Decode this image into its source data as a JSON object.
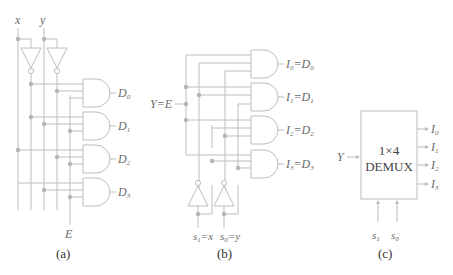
{
  "panels": {
    "a": {
      "caption": "(a)",
      "inputs": {
        "x": "x",
        "y": "y",
        "enable": "E"
      },
      "outputs": [
        {
          "name": "D",
          "sub": "0"
        },
        {
          "name": "D",
          "sub": "1"
        },
        {
          "name": "D",
          "sub": "2"
        },
        {
          "name": "D",
          "sub": "3"
        }
      ],
      "gates": {
        "not_count": 2,
        "and_count": 4
      }
    },
    "b": {
      "caption": "(b)",
      "data_input": "Y=E",
      "select_labels": [
        {
          "name": "s",
          "sub": "1",
          "eq": "=x"
        },
        {
          "name": "s",
          "sub": "0",
          "eq": "=y"
        }
      ],
      "outputs": [
        {
          "name": "I",
          "sub": "0",
          "eq": "=D",
          "eq_sub": "0"
        },
        {
          "name": "I",
          "sub": "1",
          "eq": "=D",
          "eq_sub": "1"
        },
        {
          "name": "I",
          "sub": "2",
          "eq": "=D",
          "eq_sub": "2"
        },
        {
          "name": "I",
          "sub": "3",
          "eq": "=D",
          "eq_sub": "3"
        }
      ],
      "gates": {
        "not_count": 2,
        "and_count": 4
      }
    },
    "c": {
      "caption": "(c)",
      "block_line1": "1×4",
      "block_line2": "DEMUX",
      "input": "Y",
      "outputs": [
        {
          "name": "I",
          "sub": "0"
        },
        {
          "name": "I",
          "sub": "1"
        },
        {
          "name": "I",
          "sub": "2"
        },
        {
          "name": "I",
          "sub": "3"
        }
      ],
      "selects": [
        {
          "name": "s",
          "sub": "1"
        },
        {
          "name": "s",
          "sub": "0"
        }
      ]
    }
  },
  "colors": {
    "wire": "#bdbdbd",
    "junction": "#b5b5b5",
    "label": "#6a6a6a",
    "caption": "#333333"
  }
}
